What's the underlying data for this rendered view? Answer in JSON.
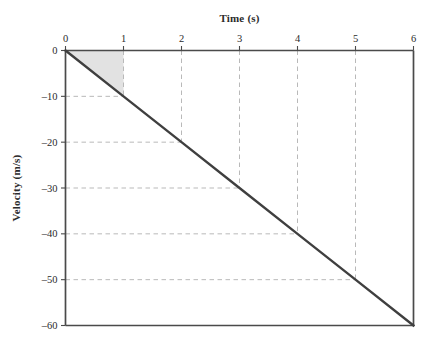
{
  "chart_data": {
    "type": "line",
    "title": "",
    "xlabel": "Time (s)",
    "ylabel": "Velocity (m/s)",
    "xlim": [
      0,
      6
    ],
    "ylim": [
      -60,
      0
    ],
    "xticks": [
      0,
      1,
      2,
      3,
      4,
      5,
      6
    ],
    "xtick_labels": [
      "0",
      "1",
      "2",
      "3",
      "4",
      "5",
      "6"
    ],
    "yticks": [
      0,
      -10,
      -20,
      -30,
      -40,
      -50,
      -60
    ],
    "ytick_labels": [
      "0",
      "–10",
      "–20",
      "–30",
      "–40",
      "–50",
      "–60"
    ],
    "x_axis_position": "top",
    "y_axis_position": "left",
    "grid": "dashed-guide-lines-to-curve",
    "legend": "none",
    "series": [
      {
        "name": "velocity",
        "x": [
          0,
          1,
          2,
          3,
          4,
          5,
          6
        ],
        "values": [
          0,
          -10,
          -20,
          -30,
          -40,
          -50,
          -60
        ],
        "color": "#3f3f3f",
        "line_width": 2.4
      }
    ],
    "guide_points": [
      {
        "x": 1,
        "y": -10
      },
      {
        "x": 2,
        "y": -20
      },
      {
        "x": 3,
        "y": -30
      },
      {
        "x": 4,
        "y": -40
      },
      {
        "x": 5,
        "y": -50
      }
    ],
    "shaded_region": {
      "label": "",
      "polygon": [
        [
          0,
          0
        ],
        [
          1,
          0
        ],
        [
          1,
          -10
        ]
      ],
      "fill": "#e2e2e2",
      "description": "area under velocity curve from t=0 to t=1"
    },
    "colors": {
      "line": "#3f3f3f",
      "axis": "#4a4a4a",
      "grid": "#b9b9b9",
      "shade": "#e2e2e2",
      "text": "#2b2b2b",
      "background": "#ffffff"
    }
  }
}
